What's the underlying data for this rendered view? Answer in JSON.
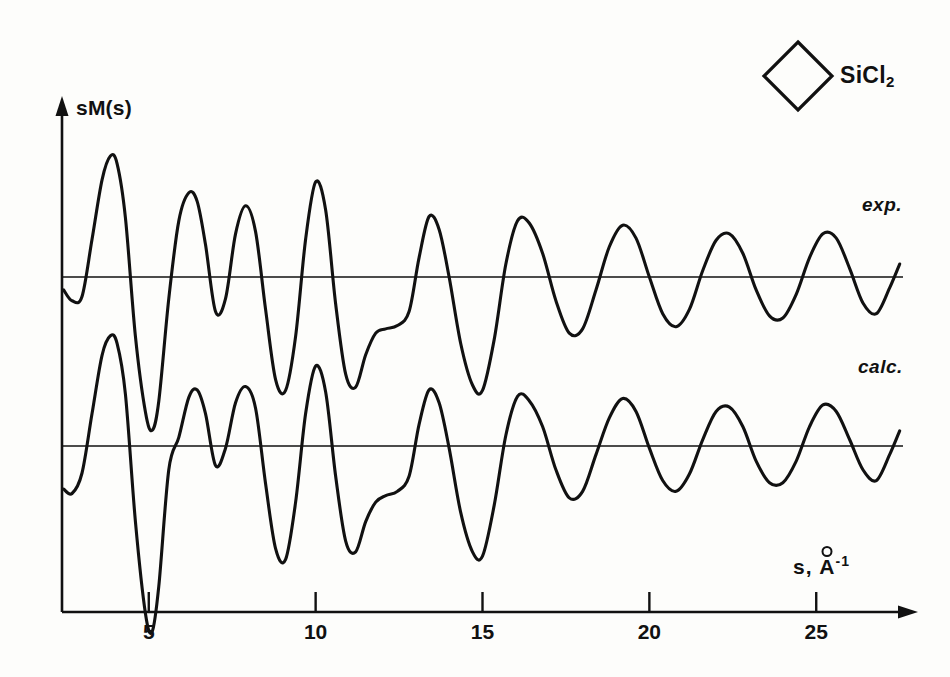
{
  "figure": {
    "kind": "electron-diffraction-molecular-intensity",
    "molecule_label": "SiCl",
    "molecule_subscript": "2",
    "molecule_icon": "cyclobutane-ring-diamond"
  },
  "axes": {
    "y_label": "sM(s)",
    "x_label_prefix": "s, ",
    "x_label_unit": "A",
    "x_label_exponent": "-1",
    "x_ticks": [
      5,
      10,
      15,
      20,
      25
    ],
    "x_tick_labels": [
      "5",
      "10",
      "15",
      "20",
      "25"
    ],
    "x_min": 2.4,
    "x_max": 27.6,
    "axis_color": "#111111",
    "arrow_x": "right",
    "arrow_y": "up"
  },
  "curves": [
    {
      "name": "exp",
      "label": "exp.",
      "label_x": 862,
      "label_y": 205
    },
    {
      "name": "calc",
      "label": "calc.",
      "label_x": 858,
      "label_y": 366
    }
  ],
  "chart_data": {
    "type": "line",
    "title": "",
    "xlabel": "s, Å⁻¹",
    "ylabel": "sM(s)",
    "xlim": [
      2.4,
      27.6
    ],
    "grid": false,
    "legend": [
      "exp.",
      "calc."
    ],
    "legend_position": "inline-right",
    "baselines": {
      "exp": 0,
      "calc": 0
    },
    "x": [
      2.45,
      2.7,
      3.0,
      3.3,
      3.6,
      3.85,
      4.05,
      4.3,
      4.6,
      4.9,
      5.1,
      5.3,
      5.6,
      5.9,
      6.2,
      6.45,
      6.7,
      7.0,
      7.3,
      7.6,
      7.9,
      8.2,
      8.5,
      8.8,
      9.1,
      9.4,
      9.7,
      10.0,
      10.3,
      10.6,
      10.9,
      11.2,
      11.5,
      11.8,
      12.1,
      12.45,
      12.8,
      13.1,
      13.4,
      13.7,
      14.0,
      14.35,
      14.7,
      15.0,
      15.35,
      15.7,
      16.05,
      16.4,
      16.8,
      17.2,
      17.6,
      18.0,
      18.4,
      18.8,
      19.2,
      19.6,
      20.0,
      20.4,
      20.8,
      21.2,
      21.6,
      22.0,
      22.4,
      22.8,
      23.2,
      23.6,
      24.0,
      24.4,
      24.8,
      25.2,
      25.6,
      26.0,
      26.4,
      26.8,
      27.2,
      27.5
    ],
    "series": [
      {
        "name": "exp.",
        "values": [
          -0.12,
          -0.22,
          -0.18,
          0.35,
          0.9,
          1.12,
          1.05,
          0.55,
          -0.55,
          -1.25,
          -1.42,
          -1.15,
          -0.2,
          0.52,
          0.78,
          0.7,
          0.3,
          -0.32,
          -0.2,
          0.4,
          0.66,
          0.42,
          -0.3,
          -0.95,
          -1.05,
          -0.55,
          0.35,
          0.88,
          0.62,
          -0.25,
          -0.9,
          -1.02,
          -0.72,
          -0.52,
          -0.48,
          -0.45,
          -0.32,
          0.18,
          0.56,
          0.44,
          0.0,
          -0.62,
          -1.0,
          -1.05,
          -0.58,
          0.12,
          0.52,
          0.5,
          0.22,
          -0.22,
          -0.52,
          -0.48,
          -0.12,
          0.28,
          0.48,
          0.36,
          0.0,
          -0.34,
          -0.46,
          -0.3,
          0.06,
          0.34,
          0.4,
          0.22,
          -0.12,
          -0.36,
          -0.38,
          -0.16,
          0.18,
          0.4,
          0.36,
          0.08,
          -0.24,
          -0.34,
          -0.1,
          0.12
        ]
      },
      {
        "name": "calc.",
        "values": [
          -0.4,
          -0.44,
          -0.25,
          0.3,
          0.84,
          1.02,
          0.95,
          0.48,
          -0.7,
          -1.55,
          -1.72,
          -1.3,
          -0.22,
          0.08,
          0.45,
          0.52,
          0.3,
          -0.18,
          -0.02,
          0.4,
          0.55,
          0.35,
          -0.35,
          -0.95,
          -1.05,
          -0.52,
          0.3,
          0.74,
          0.5,
          -0.28,
          -0.88,
          -0.98,
          -0.7,
          -0.52,
          -0.46,
          -0.42,
          -0.28,
          0.2,
          0.52,
          0.4,
          -0.02,
          -0.62,
          -0.98,
          -1.02,
          -0.55,
          0.1,
          0.46,
          0.42,
          0.18,
          -0.22,
          -0.48,
          -0.42,
          -0.08,
          0.26,
          0.44,
          0.32,
          -0.02,
          -0.32,
          -0.42,
          -0.26,
          0.06,
          0.32,
          0.36,
          0.18,
          -0.14,
          -0.34,
          -0.34,
          -0.14,
          0.18,
          0.38,
          0.32,
          0.06,
          -0.22,
          -0.32,
          -0.08,
          0.14
        ]
      }
    ]
  }
}
